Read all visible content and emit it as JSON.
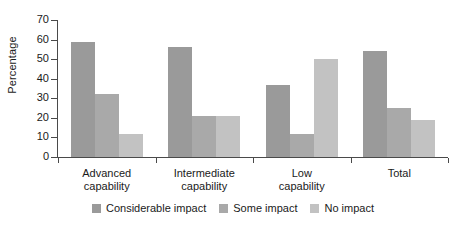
{
  "chart_data": {
    "type": "bar",
    "title": "",
    "xlabel": "",
    "ylabel": "Percentage",
    "ylim": [
      0,
      70
    ],
    "yticks": [
      0,
      10,
      20,
      30,
      40,
      50,
      60,
      70
    ],
    "ytick_labels": [
      "0",
      "10",
      "20",
      "30",
      "40",
      "50",
      "60",
      "70"
    ],
    "grid": false,
    "legend_position": "bottom-center",
    "categories": [
      "Advanced capability",
      "Intermediate capability",
      "Low capability",
      "Total"
    ],
    "category_lines": [
      [
        "Advanced",
        "capability"
      ],
      [
        "Intermediate",
        "capability"
      ],
      [
        "Low",
        "capability"
      ],
      [
        "Total",
        ""
      ]
    ],
    "series": [
      {
        "name": "Considerable impact",
        "color": "#9a9a9a",
        "values": [
          59,
          56,
          37,
          54
        ]
      },
      {
        "name": "Some impact",
        "color": "#a9a9a9",
        "values": [
          32,
          21,
          12,
          25
        ]
      },
      {
        "name": "No impact",
        "color": "#c2c2c2",
        "values": [
          12,
          21,
          50,
          19
        ]
      }
    ]
  },
  "axis": {
    "line_color": "#4a4a4a",
    "text_color": "#1a1a1a"
  }
}
